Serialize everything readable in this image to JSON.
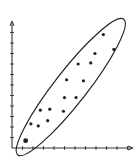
{
  "chart_data": {
    "type": "scatter",
    "title": "",
    "xlabel": "",
    "ylabel": "",
    "xlim": [
      0,
      11.5
    ],
    "ylim": [
      0,
      12
    ],
    "grid": false,
    "legend": null,
    "x_ticks": 11,
    "y_ticks": 12,
    "series": [
      {
        "name": "points",
        "x": [
          1.3,
          1.8,
          2.5,
          3.4,
          2.7,
          3.6,
          4.9,
          5.0,
          6.1,
          5.2,
          6.8,
          6.3,
          7.5,
          7.9,
          8.7,
          9.7
        ],
        "y": [
          0.7,
          2.3,
          2.1,
          2.6,
          3.6,
          3.7,
          3.5,
          4.8,
          4.8,
          6.5,
          6.4,
          8.0,
          8.1,
          9.0,
          10.8,
          9.4
        ]
      }
    ],
    "annotations": [
      {
        "type": "ellipse",
        "description": "elongated ellipse enclosing all points along positive diagonal",
        "center": [
          5.6,
          5.8
        ],
        "angle_deg": 52,
        "semi_major": 8.2,
        "semi_minor": 1.55
      }
    ]
  },
  "colors": {
    "axis": "#333333",
    "points": "#222222",
    "ellipse": "#222222",
    "background": "#ffffff"
  }
}
